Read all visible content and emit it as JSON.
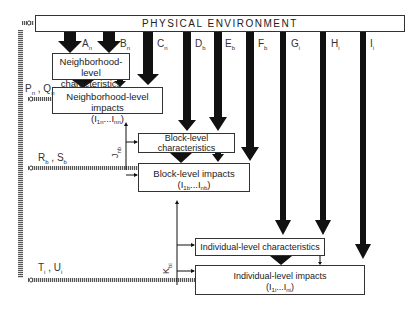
{
  "header": {
    "title": "PHYSICAL ENVIRONMENT"
  },
  "boxes": {
    "neighborhood_characteristics": {
      "line1": "Neighborhood-level",
      "line2": "characteristics"
    },
    "neighborhood_impacts": {
      "line1": "Neighborhood-level impacts",
      "line2_main": "(I",
      "line2_sub1": "1n",
      "line2_mid": "...I",
      "line2_sub2": "nn",
      "line2_end": ")"
    },
    "block_characteristics": {
      "line1": "Block-level",
      "line2": "characteristics"
    },
    "block_impacts": {
      "line1": "Block-level impacts",
      "line2_main": "(I",
      "line2_sub1": "1b",
      "line2_mid": "...I",
      "line2_sub2": "nb",
      "line2_end": ")"
    },
    "individual_characteristics": {
      "line1": "Individual-level characteristics"
    },
    "individual_impacts": {
      "line1": "Individual-level impacts",
      "line2_main": "(I",
      "line2_sub1": "1i",
      "line2_mid": "...I",
      "line2_sub2": "ni",
      "line2_end": ")"
    }
  },
  "arrow_labels": {
    "A": {
      "main": "A",
      "sub": "n"
    },
    "B": {
      "main": "B",
      "sub": "n"
    },
    "C": {
      "main": "C",
      "sub": "n"
    },
    "D": {
      "main": "D",
      "sub": "b"
    },
    "E": {
      "main": "E",
      "sub": "b"
    },
    "F": {
      "main": "F",
      "sub": "b"
    },
    "G": {
      "main": "G",
      "sub": "i"
    },
    "H": {
      "main": "H",
      "sub": "i"
    },
    "I": {
      "main": "I",
      "sub": "i"
    }
  },
  "feedback_labels": {
    "PQ": {
      "p": "P",
      "p_sub": "n",
      "q": "Q",
      "q_sub": "n"
    },
    "RS": {
      "r": "R",
      "r_sub": "b",
      "s": "S",
      "s_sub": "b"
    },
    "TU": {
      "t": "T",
      "t_sub": "i",
      "u": "U",
      "u_sub": "i"
    },
    "J": {
      "main": "J",
      "sub": "nb"
    },
    "K": {
      "main": "K",
      "sub": "bi"
    }
  }
}
